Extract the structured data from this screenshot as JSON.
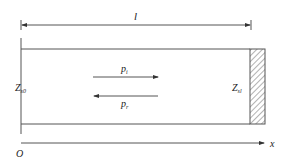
{
  "diagram": {
    "length_label": "l",
    "incident_wave": {
      "symbol": "p",
      "subscript": "i"
    },
    "reflected_wave": {
      "symbol": "p",
      "subscript": "r"
    },
    "left_impedance": {
      "symbol": "Z",
      "subscript": "s0"
    },
    "right_impedance": {
      "symbol": "Z",
      "subscript": "sl"
    },
    "origin_label": "O",
    "axis_label": "x",
    "colors": {
      "line": "#555555",
      "text": "#222222",
      "hatch": "#666666"
    }
  }
}
